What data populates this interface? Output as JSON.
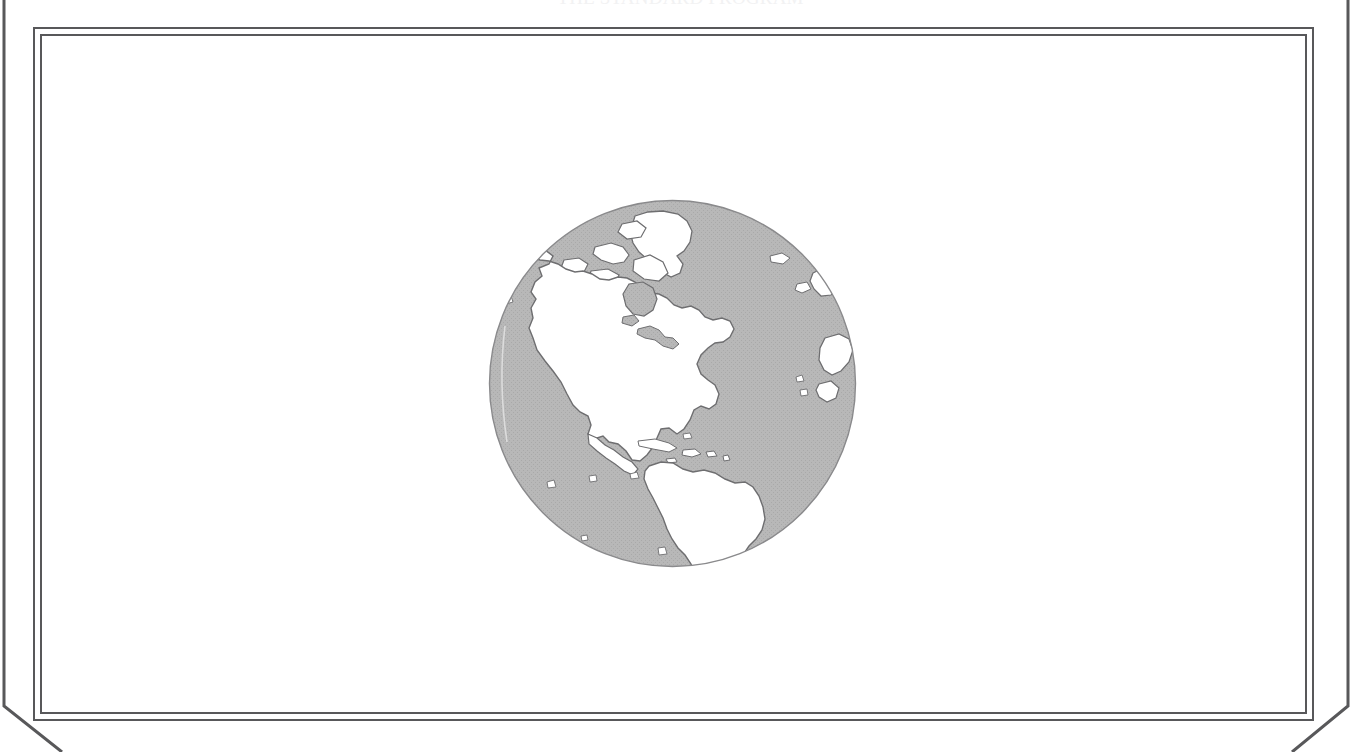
{
  "page": {
    "width": 1361,
    "height": 752,
    "background_color": "#ffffff",
    "top_caption": "THE STANDARD PROGRAM"
  },
  "frame": {
    "line_color": "#58585a",
    "outer_rule_name": "bevelled-outer-rule",
    "inner_frame_name": "double-line-frame",
    "field_color": "#ffffff"
  },
  "illustration": {
    "title": "globe-western-hemisphere",
    "caption": "",
    "projection": "orthographic",
    "center_longitude": -75,
    "center_latitude": 20,
    "ocean_color": "#b6b6b6",
    "land_color": "#ffffff",
    "outline_color": "#6e6e70",
    "center_x": 672,
    "center_y": 383,
    "radius": 185,
    "landmasses": [
      "North America",
      "South America",
      "Greenland",
      "Canadian Arctic Archipelago",
      "Caribbean Islands",
      "Western Europe",
      "Northwest Africa",
      "Iceland"
    ],
    "features": [
      "Hudson Bay",
      "Great Lakes",
      "Gulf of Mexico",
      "Alaska",
      "Baja California",
      "Florida Peninsula",
      "Amazon Basin"
    ]
  }
}
